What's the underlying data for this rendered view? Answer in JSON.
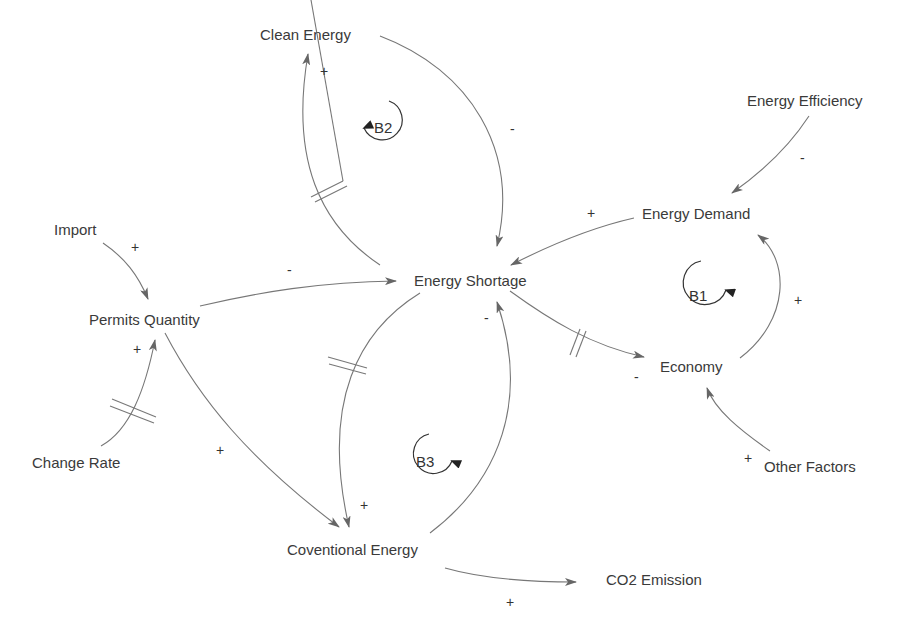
{
  "diagram": {
    "type": "causal-loop-diagram",
    "nodes": {
      "clean_energy": "Clean Energy",
      "energy_efficiency": "Energy Efficiency",
      "energy_demand": "Energy Demand",
      "import": "Import",
      "energy_shortage": "Energy Shortage",
      "permits_quantity": "Permits Quantity",
      "economy": "Economy",
      "change_rate": "Change Rate",
      "other_factors": "Other Factors",
      "conventional_energy": "Coventional Energy",
      "co2_emission": "CO2 Emission"
    },
    "loops": {
      "b1": "B1",
      "b2": "B2",
      "b3": "B3"
    },
    "links": [
      {
        "from": "Energy Shortage",
        "to": "Clean Energy",
        "polarity": "+",
        "delay": true
      },
      {
        "from": "Clean Energy",
        "to": "Energy Shortage",
        "polarity": "-",
        "delay": false
      },
      {
        "from": "Energy Efficiency",
        "to": "Energy Demand",
        "polarity": "-",
        "delay": false
      },
      {
        "from": "Energy Demand",
        "to": "Energy Shortage",
        "polarity": "+",
        "delay": false
      },
      {
        "from": "Energy Shortage",
        "to": "Economy",
        "polarity": "-",
        "delay": true
      },
      {
        "from": "Economy",
        "to": "Energy Demand",
        "polarity": "+",
        "delay": false
      },
      {
        "from": "Other Factors",
        "to": "Economy",
        "polarity": "+",
        "delay": false
      },
      {
        "from": "Import",
        "to": "Permits Quantity",
        "polarity": "+",
        "delay": false
      },
      {
        "from": "Permits Quantity",
        "to": "Energy Shortage",
        "polarity": "-",
        "delay": false
      },
      {
        "from": "Change Rate",
        "to": "Permits Quantity",
        "polarity": "+",
        "delay": true
      },
      {
        "from": "Permits Quantity",
        "to": "Coventional Energy",
        "polarity": "+",
        "delay": false
      },
      {
        "from": "Energy Shortage",
        "to": "Coventional Energy",
        "polarity": "+",
        "delay": true
      },
      {
        "from": "Coventional Energy",
        "to": "Energy Shortage",
        "polarity": "-",
        "delay": false
      },
      {
        "from": "Coventional Energy",
        "to": "CO2 Emission",
        "polarity": "+",
        "delay": false
      }
    ],
    "signs": {
      "s_clean_in": "+",
      "s_clean_out": "-",
      "s_eff": "-",
      "s_demand": "+",
      "s_econ_in": "-",
      "s_econ_out": "+",
      "s_other": "+",
      "s_import": "+",
      "s_permits_out": "-",
      "s_change": "+",
      "s_permits_conv": "+",
      "s_short_conv": "+",
      "s_conv_short": "-",
      "s_co2": "+"
    }
  }
}
